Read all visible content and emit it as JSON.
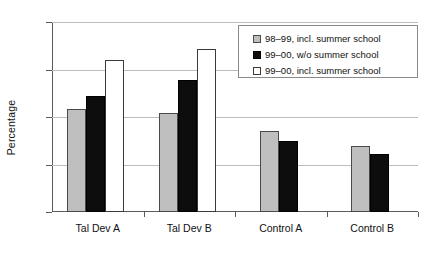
{
  "chart_data": {
    "type": "bar",
    "title": "",
    "xlabel": "",
    "ylabel": "Percentage",
    "ylim": [
      0,
      80
    ],
    "yticks": [
      0,
      20,
      40,
      60,
      80
    ],
    "ytick_labels": [
      "0",
      "20",
      "40",
      "60",
      "80"
    ],
    "grid": true,
    "legend_position": "top-right",
    "categories": [
      "Tal Dev A",
      "Tal Dev B",
      "Control A",
      "Control B"
    ],
    "series": [
      {
        "name": "98–99, incl. summer school",
        "color": "#bfbfbf",
        "swatch": "gray",
        "values": [
          43.5,
          41.5,
          34,
          28
        ]
      },
      {
        "name": "99–00, w/o summer school",
        "color": "#0d0d0d",
        "swatch": "black",
        "values": [
          49,
          55.5,
          30,
          24.5
        ]
      },
      {
        "name": "99–00, incl. summer school",
        "color": "#ffffff",
        "swatch": "white",
        "values": [
          64,
          68.5,
          null,
          null
        ]
      }
    ]
  },
  "legend": {
    "items": [
      {
        "label": "98–99, incl. summer school",
        "swatch": "gray"
      },
      {
        "label": "99–00, w/o summer school",
        "swatch": "black"
      },
      {
        "label": "99–00, incl. summer school",
        "swatch": "white"
      }
    ]
  }
}
